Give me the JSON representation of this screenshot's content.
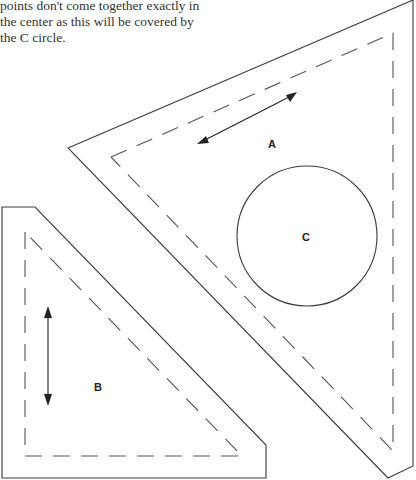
{
  "caption": {
    "lines": [
      "points don't come together exactly in",
      "the center as this will be covered by",
      "the C circle."
    ]
  },
  "pieces": {
    "a": {
      "label": "A",
      "grainline": "double-arrow-diagonal"
    },
    "b": {
      "label": "B",
      "grainline": "double-arrow-vertical"
    },
    "c": {
      "label": "C",
      "shape": "circle"
    }
  },
  "legend": {
    "cut_line": "solid",
    "seam_line": "dashed"
  }
}
